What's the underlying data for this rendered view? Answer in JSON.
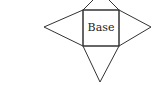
{
  "diagram": {
    "base_label": "Base",
    "stroke_color": "#333333",
    "background": "#ffffff"
  }
}
